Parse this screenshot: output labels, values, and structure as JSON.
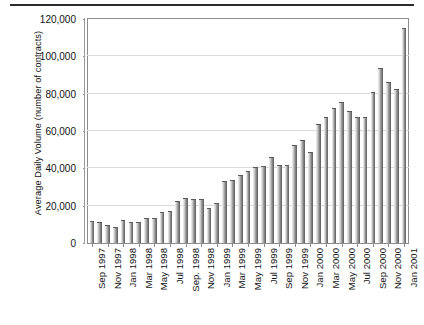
{
  "chart_data": {
    "type": "bar",
    "title": "",
    "subtitle": "",
    "xlabel": "",
    "ylabel": "Average Daily Volume (number of contracts)",
    "ylim": [
      0,
      120000
    ],
    "ytick_values": [
      0,
      20000,
      40000,
      60000,
      80000,
      100000,
      120000
    ],
    "ytick_labels": [
      "0",
      "20,000",
      "40,000",
      "60,000",
      "80,000",
      "100,000",
      "120,000"
    ],
    "grid": true,
    "legend": null,
    "legend_position": "none",
    "bar_color": "#8c8c8c",
    "categories": [
      "Sep 1997",
      "Oct 1997",
      "Nov 1997",
      "Dec 1997",
      "Jan 1998",
      "Feb 1998",
      "Mar 1998",
      "Apr 1998",
      "May 1998",
      "Jun 1998",
      "Jul 1998",
      "Aug 1998",
      "Sep. 1998",
      "Oct 1998",
      "Nov 1998",
      "Dec 1998",
      "Jan 1999",
      "Feb 1999",
      "Mar 1999",
      "Apr 1999",
      "May 1999",
      "Jun 1999",
      "Jul 1999",
      "Aug 1999",
      "Sep 1999",
      "Oct 1999",
      "Nov 1999",
      "Dec 1999",
      "Jan 2000",
      "Feb 2000",
      "Mar 2000",
      "Apr 2000",
      "May 2000",
      "Jun 2000",
      "Jul 2000",
      "Aug 2000",
      "Sep 2000",
      "Oct 2000",
      "Nov 2000",
      "Dec 2000",
      "Jan 2001"
    ],
    "xtick_labels": [
      "Sep 1997",
      "Nov 1997",
      "Jan 1998",
      "Mar 1998",
      "May 1998",
      "Jul 1998",
      "Sep. 1998",
      "Nov 1998",
      "Jan 1999",
      "Mar 1999",
      "May 1999",
      "Jul 1999",
      "Sep 1999",
      "Nov 1999",
      "Jan 2000",
      "Mar 2000",
      "May 2000",
      "Jul 2000",
      "Sep 2000",
      "Nov 2000",
      "Jan 2001"
    ],
    "xtick_indices": [
      0,
      2,
      4,
      6,
      8,
      10,
      12,
      14,
      16,
      18,
      20,
      22,
      24,
      26,
      28,
      30,
      32,
      34,
      36,
      38,
      40
    ],
    "values": [
      12000,
      11500,
      9500,
      8500,
      12500,
      11000,
      11500,
      13500,
      13500,
      16500,
      17000,
      22500,
      24000,
      23500,
      23500,
      18500,
      21500,
      33000,
      33500,
      36500,
      38500,
      40500,
      41500,
      46000,
      42000,
      42000,
      52500,
      55000,
      48500,
      63500,
      67500,
      72500,
      75500,
      70500,
      67500,
      67500,
      81000,
      94000,
      86500,
      82500,
      115000
    ]
  }
}
